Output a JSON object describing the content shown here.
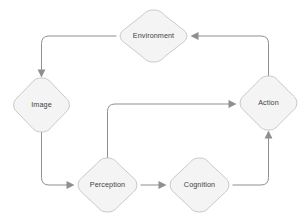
{
  "diagram": {
    "type": "flow-cycle-diagram",
    "background_color": "#ffffff",
    "node_fill_color": "#f4f4f4",
    "node_border_color": "#c9c9c9",
    "node_text_color": "#3f3f3f",
    "edge_color": "#8f8f8f",
    "node_shape": "rounded-diamond",
    "nodes": [
      {
        "id": "environment",
        "label": "Environment",
        "cx": 153.5,
        "cy": 36,
        "rx": 36.5,
        "ry": 26
      },
      {
        "id": "image",
        "label": "Image",
        "cx": 41.5,
        "cy": 105,
        "rx": 30.5,
        "ry": 27
      },
      {
        "id": "action",
        "label": "Action",
        "cx": 268.5,
        "cy": 103,
        "rx": 31.5,
        "ry": 27
      },
      {
        "id": "perception",
        "label": "Perception",
        "cx": 107.5,
        "cy": 185,
        "rx": 32.5,
        "ry": 27
      },
      {
        "id": "cognition",
        "label": "Cognition",
        "cx": 199.5,
        "cy": 185,
        "rx": 32.5,
        "ry": 27
      }
    ],
    "edges": [
      {
        "id": "environment-to-image",
        "from": "environment",
        "to": "image",
        "arrow_direction": "down"
      },
      {
        "id": "image-to-perception",
        "from": "image",
        "to": "perception",
        "arrow_direction": "right"
      },
      {
        "id": "perception-to-cognition",
        "from": "perception",
        "to": "cognition",
        "arrow_direction": "right"
      },
      {
        "id": "perception-to-action",
        "from": "perception",
        "to": "action",
        "arrow_direction": "right"
      },
      {
        "id": "cognition-to-action",
        "from": "cognition",
        "to": "action",
        "arrow_direction": "up"
      },
      {
        "id": "action-to-environment",
        "from": "action",
        "to": "environment",
        "arrow_direction": "left"
      }
    ]
  }
}
